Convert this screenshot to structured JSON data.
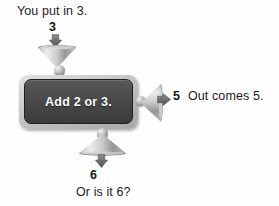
{
  "diagram": {
    "title_visible": false,
    "background_color": "#fefefe",
    "machine": {
      "label": "Add 2 or 3.",
      "body_color": "#4a4a4a",
      "frame_color": "#c6c6c6",
      "label_color": "#fdfdfd"
    },
    "input": {
      "caption": "You put in 3.",
      "value": "3",
      "arrow_direction": "down",
      "funnel_name": "input-funnel"
    },
    "output_right": {
      "caption": "Out comes 5.",
      "value": "5",
      "arrow_direction": "right",
      "spout_name": "output-spout-right"
    },
    "output_bottom": {
      "caption": "Or is it 6?",
      "value": "6",
      "arrow_direction": "down",
      "spout_name": "output-spout-bottom"
    },
    "icons": {
      "ball_top": "metal-ball-icon",
      "ball_right": "metal-ball-icon",
      "ball_bottom": "metal-ball-icon"
    }
  }
}
